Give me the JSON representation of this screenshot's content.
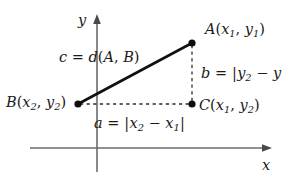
{
  "figure": {
    "background_color": "#ffffff",
    "stroke_color": "#1a1a1a",
    "axis_color": "#6b6b6b"
  },
  "axes": {
    "x_label": "x",
    "y_label": "y",
    "x_axis": {
      "x1": 30,
      "y1": 148,
      "x2": 272,
      "y2": 148,
      "arrow": "right"
    },
    "y_axis": {
      "x1": 97,
      "y1": 172,
      "x2": 97,
      "y2": 14,
      "arrow": "up"
    }
  },
  "points": [
    {
      "name": "A",
      "label_text": "A(x1, y1)",
      "x": 192,
      "y": 43
    },
    {
      "name": "B",
      "label_text": "B(x2, y2)",
      "x": 78,
      "y": 104
    },
    {
      "name": "C",
      "label_text": "C(x1, y2)",
      "x": 192,
      "y": 104
    }
  ],
  "segments": {
    "hypotenuse": {
      "from": "B",
      "to": "A",
      "style": "solid",
      "label": "c = d(A, B)"
    },
    "vertical": {
      "from": "A",
      "to": "C",
      "style": "dashed",
      "label": "b = |y2 - y"
    },
    "horizontal": {
      "from": "B",
      "to": "C",
      "style": "dashed",
      "label": "a = |x2 - x1|"
    }
  },
  "labels": {
    "point_a": {
      "letter": "A",
      "open": "(",
      "v1": "x",
      "s1": "1",
      "comma": ", ",
      "v2": "y",
      "s2": "1",
      "close": ")"
    },
    "point_b": {
      "letter": "B",
      "open": "(",
      "v1": "x",
      "s1": "2",
      "comma": ", ",
      "v2": "y",
      "s2": "2",
      "close": ")"
    },
    "point_c": {
      "letter": "C",
      "open": "(",
      "v1": "x",
      "s1": "1",
      "comma": ", ",
      "v2": "y",
      "s2": "2",
      "close": ")"
    },
    "side_c": {
      "lead": "c",
      "eq": " = ",
      "fn": "d",
      "open": "(",
      "arg1": "A",
      "comma": ", ",
      "arg2": "B",
      "close": ")"
    },
    "side_b": {
      "lead": "b",
      "eq": " = ",
      "bar": "|",
      "v1": "y",
      "s1": "2",
      "minus": " − ",
      "v2": "y"
    },
    "side_a": {
      "lead": "a",
      "eq": " = ",
      "bar_open": "|",
      "v1": "x",
      "s1": "2",
      "minus": " − ",
      "v2": "x",
      "s2": "1",
      "bar_close": "|"
    }
  }
}
